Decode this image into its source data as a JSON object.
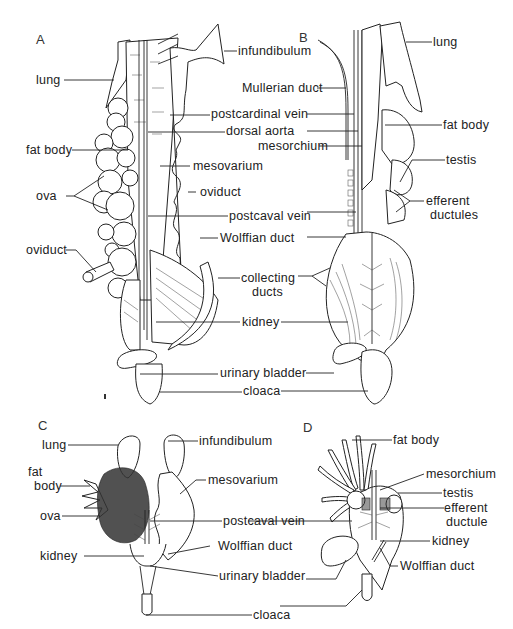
{
  "figure": {
    "panels": [
      {
        "id": "A",
        "letter": "A",
        "labels": {
          "infundibulum": "infundibulum",
          "lung": "lung",
          "postcardinal_vein": "postcardinal vein",
          "dorsal_aorta": "dorsal aorta",
          "fat_body": "fat body",
          "mesovarium": "mesovarium",
          "ova": "ova",
          "oviduct_right": "oviduct",
          "postcaval_vein": "postcaval vein",
          "oviduct_left": "oviduct",
          "wolffian_duct": "Wolffian duct",
          "collecting_ducts_1": "collecting",
          "collecting_ducts_2": "ducts",
          "kidney": "kidney",
          "urinary_bladder": "urinary bladder",
          "cloaca": "cloaca"
        }
      },
      {
        "id": "B",
        "letter": "B",
        "labels": {
          "lung": "lung",
          "mullerian_duct": "Mullerian duct",
          "fat_body": "fat body",
          "mesorchium": "mesorchium",
          "testis": "testis",
          "efferent_ductules_1": "efferent",
          "efferent_ductules_2": "ductules"
        }
      },
      {
        "id": "C",
        "letter": "C",
        "labels": {
          "lung": "lung",
          "infundibulum": "infundibulum",
          "fat_body_1": "fat",
          "fat_body_2": "body",
          "mesovarium": "mesovarium",
          "ova": "ova",
          "postcaval_vein": "postcaval vein",
          "kidney": "kidney",
          "wolffian_duct": "Wolffian duct",
          "urinary_bladder": "urinary bladder",
          "cloaca": "cloaca"
        }
      },
      {
        "id": "D",
        "letter": "D",
        "labels": {
          "fat_body": "fat body",
          "mesorchium": "mesorchium",
          "testis": "testis",
          "efferent_ductule_1": "efferent",
          "efferent_ductule_2": "ductule",
          "kidney": "kidney",
          "wolffian_duct": "Wolffian duct"
        }
      }
    ]
  }
}
